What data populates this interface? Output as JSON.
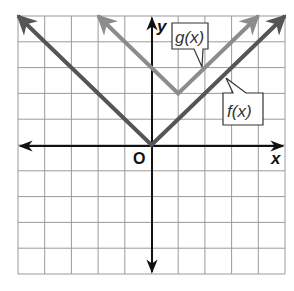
{
  "chart_data": {
    "type": "line",
    "title": "",
    "xlabel": "x",
    "ylabel": "y",
    "origin_label": "O",
    "xlim": [
      -5,
      5
    ],
    "ylim": [
      -5,
      5
    ],
    "grid": true,
    "grid_step": 1,
    "series": [
      {
        "name": "f(x)",
        "expression": "|x|",
        "vertex": [
          0,
          0
        ],
        "points": [
          [
            -5,
            5
          ],
          [
            0,
            0
          ],
          [
            5,
            5
          ]
        ],
        "color": "#555555"
      },
      {
        "name": "g(x)",
        "expression": "|x - 1| + 2",
        "vertex": [
          1,
          2
        ],
        "points": [
          [
            -2,
            5
          ],
          [
            1,
            2
          ],
          [
            4,
            5
          ]
        ],
        "color": "#8c8c8c"
      }
    ]
  },
  "labels": {
    "x_axis": "x",
    "y_axis": "y",
    "origin": "O",
    "f": "f(x)",
    "g": "g(x)"
  },
  "colors": {
    "grid": "#9a9a9a",
    "axes": "#111111",
    "f": "#555555",
    "g": "#8c8c8c"
  }
}
